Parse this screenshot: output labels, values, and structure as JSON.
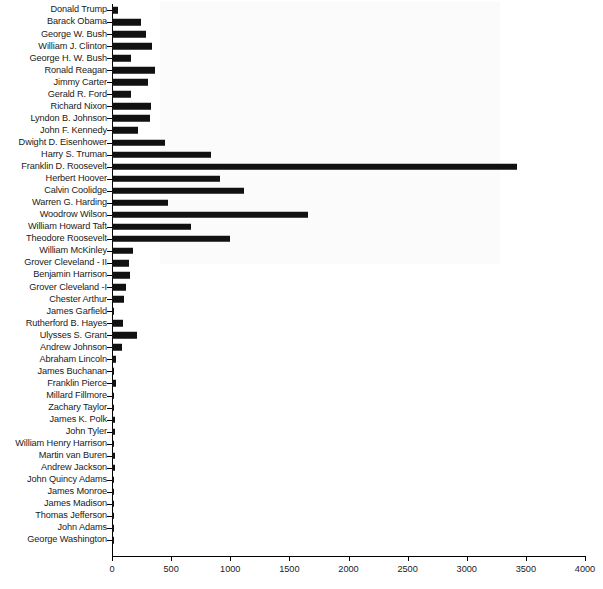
{
  "chart_data": {
    "type": "bar",
    "orientation": "horizontal",
    "title": "",
    "subtitle": "",
    "xlabel": "",
    "ylabel": "",
    "xlim": [
      0,
      4000
    ],
    "xticks": [
      0,
      500,
      1000,
      1500,
      2000,
      2500,
      3000,
      3500,
      4000
    ],
    "grid": false,
    "legend": false,
    "bar_color": "#111111",
    "background_color": "#ffffff",
    "categories": [
      "Donald Trump",
      "Barack Obama",
      "George W. Bush",
      "William J. Clinton",
      "George H. W. Bush",
      "Ronald Reagan",
      "Jimmy Carter",
      "Gerald R. Ford",
      "Richard Nixon",
      "Lyndon B. Johnson",
      "John F. Kennedy",
      "Dwight D. Eisenhower",
      "Harry S. Truman",
      "Franklin D. Roosevelt",
      "Herbert Hoover",
      "Calvin Coolidge",
      "Warren G. Harding",
      "Woodrow Wilson",
      "William Howard Taft",
      "Theodore Roosevelt",
      "William McKinley",
      "Grover Cleveland - II",
      "Benjamin Harrison",
      "Grover Cleveland -I",
      "Chester Arthur",
      "James Garfield",
      "Rutherford B. Hayes",
      "Ulysses S. Grant",
      "Andrew Johnson",
      "Abraham Lincoln",
      "James Buchanan",
      "Franklin Pierce",
      "Millard Fillmore",
      "Zachary Taylor",
      "James K. Polk",
      "John Tyler",
      "William Henry Harrison",
      "Martin van Buren",
      "Andrew Jackson",
      "John Quincy Adams",
      "James Monroe",
      "James Madison",
      "Thomas Jefferson",
      "John Adams",
      "George Washington"
    ],
    "values": [
      51,
      245,
      288,
      338,
      161,
      364,
      304,
      160,
      330,
      322,
      220,
      448,
      837,
      3425,
      913,
      1116,
      474,
      1658,
      668,
      998,
      178,
      144,
      152,
      118,
      101,
      8,
      93,
      211,
      85,
      36,
      14,
      30,
      12,
      6,
      28,
      26,
      4,
      22,
      24,
      6,
      8,
      6,
      6,
      4,
      10
    ]
  }
}
